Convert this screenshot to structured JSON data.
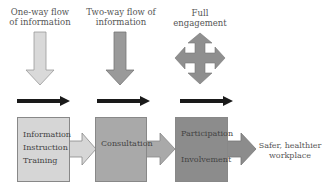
{
  "diagram": {
    "stages": [
      {
        "header": [
          "One-way flow",
          "of information"
        ],
        "box_items": [
          "Information",
          "Instruction",
          "Training"
        ],
        "fill": "#d6d6d6",
        "arrow_icon": "down-arrow"
      },
      {
        "header": [
          "Two-way flow of",
          "information"
        ],
        "box_items": [
          "Consultation"
        ],
        "fill": "#a9a9a9",
        "arrow_icon": "down-arrow"
      },
      {
        "header": [
          "Full engagement"
        ],
        "box_items": [
          "Participation",
          "Involvement"
        ],
        "fill": "#8c8c8c",
        "arrow_icon": "four-way-arrow"
      }
    ],
    "outcome": [
      "Safer, healthier",
      "workplace"
    ],
    "progress_arrow_color": "#1a1a1a"
  }
}
